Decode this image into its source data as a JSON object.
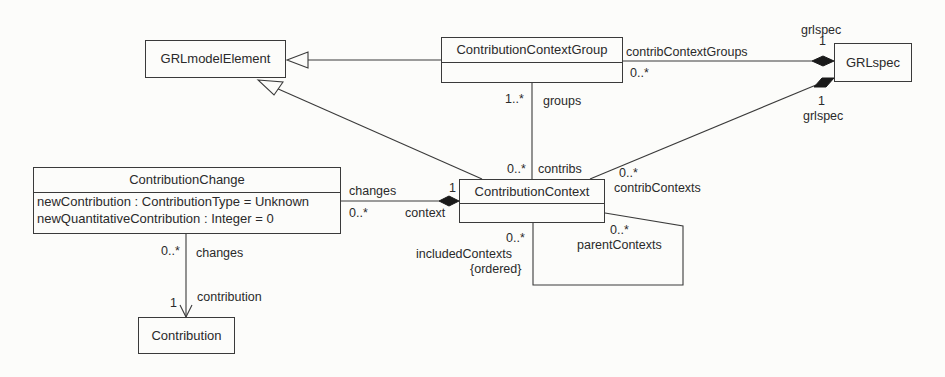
{
  "classes": {
    "grl_model_element": {
      "name": "GRLmodelElement"
    },
    "contribution_context_group": {
      "name": "ContributionContextGroup"
    },
    "grl_spec": {
      "name": "GRLspec"
    },
    "contribution_change": {
      "name": "ContributionChange",
      "attributes": [
        "newContribution : ContributionType = Unknown",
        "newQuantitativeContribution : Integer = 0"
      ]
    },
    "contribution_context": {
      "name": "ContributionContext"
    },
    "contribution": {
      "name": "Contribution"
    }
  },
  "associations": {
    "group_to_spec": {
      "role_source": "contribContextGroups",
      "mult_source": "0..*",
      "role_target": "grlspec",
      "mult_target": "1"
    },
    "context_to_spec": {
      "role_source": "contribContexts",
      "mult_source": "0..*",
      "role_target": "grlspec",
      "mult_target": "1"
    },
    "group_context": {
      "mult_group": "1..*",
      "role_group": "groups",
      "mult_context": "0..*",
      "role_context": "contribs"
    },
    "change_context": {
      "role_change": "changes",
      "mult_change": "0..*",
      "role_context": "context",
      "mult_context": "1"
    },
    "change_contribution": {
      "mult_change": "0..*",
      "role_change": "changes",
      "mult_contribution": "1",
      "role_contribution": "contribution"
    },
    "self_context": {
      "mult_included": "0..*",
      "role_included": "includedContexts",
      "constraint": "{ordered}",
      "mult_parent": "0..*",
      "role_parent": "parentContexts"
    }
  }
}
